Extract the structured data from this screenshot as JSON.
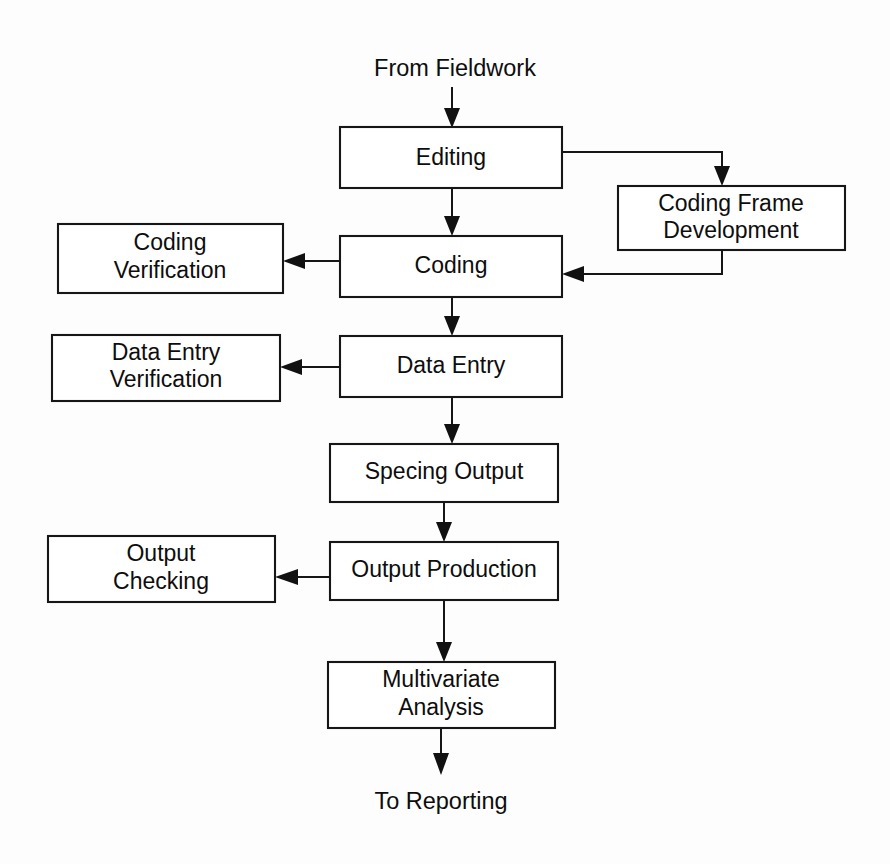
{
  "diagram": {
    "background_color": "#fdfdfd",
    "line_color": "#161616",
    "box_fill": "#ffffff",
    "text_color": "#0d0d0d",
    "entry_label": "From Fieldwork",
    "exit_label": "To Reporting",
    "nodes": [
      {
        "id": "editing",
        "label": "Editing",
        "line1": "Editing",
        "line2": ""
      },
      {
        "id": "coding_frame",
        "label": "Coding Frame Development",
        "line1": "Coding Frame",
        "line2": "Development"
      },
      {
        "id": "coding",
        "label": "Coding",
        "line1": "Coding",
        "line2": ""
      },
      {
        "id": "coding_verif",
        "label": "Coding Verification",
        "line1": "Coding",
        "line2": "Verification"
      },
      {
        "id": "data_entry",
        "label": "Data Entry",
        "line1": "Data Entry",
        "line2": ""
      },
      {
        "id": "data_entry_ver",
        "label": "Data Entry Verification",
        "line1": "Data Entry",
        "line2": "Verification"
      },
      {
        "id": "specing",
        "label": "Specing Output",
        "line1": "Specing Output",
        "line2": ""
      },
      {
        "id": "output_prod",
        "label": "Output Production",
        "line1": "Output Production",
        "line2": ""
      },
      {
        "id": "output_check",
        "label": "Output Checking",
        "line1": "Output",
        "line2": "Checking"
      },
      {
        "id": "multivariate",
        "label": "Multivariate Analysis",
        "line1": "Multivariate",
        "line2": "Analysis"
      }
    ],
    "edges": [
      {
        "id": "e-fieldwork-editing",
        "from": "From Fieldwork",
        "to": "Editing"
      },
      {
        "id": "e-editing-codingframe",
        "from": "Editing",
        "to": "Coding Frame Development"
      },
      {
        "id": "e-editing-coding",
        "from": "Editing",
        "to": "Coding"
      },
      {
        "id": "e-codingframe-coding",
        "from": "Coding Frame Development",
        "to": "Coding"
      },
      {
        "id": "e-coding-codingverif",
        "from": "Coding",
        "to": "Coding Verification"
      },
      {
        "id": "e-coding-dataentry",
        "from": "Coding",
        "to": "Data Entry"
      },
      {
        "id": "e-dataentry-dataentryver",
        "from": "Data Entry",
        "to": "Data Entry Verification"
      },
      {
        "id": "e-dataentry-specing",
        "from": "Data Entry",
        "to": "Specing Output"
      },
      {
        "id": "e-specing-outputprod",
        "from": "Specing Output",
        "to": "Output Production"
      },
      {
        "id": "e-outputprod-outputcheck",
        "from": "Output Production",
        "to": "Output Checking"
      },
      {
        "id": "e-outputprod-multivar",
        "from": "Output Production",
        "to": "Multivariate Analysis"
      },
      {
        "id": "e-multivar-reporting",
        "from": "Multivariate Analysis",
        "to": "To Reporting"
      }
    ]
  }
}
